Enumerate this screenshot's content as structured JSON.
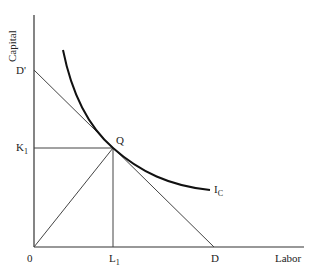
{
  "diagram": {
    "type": "isoquant-isocost",
    "axes": {
      "y_label": "Capital",
      "x_label": "Labor",
      "origin_label": "0"
    },
    "points": {
      "d_prime": "D'",
      "k1": {
        "main": "K",
        "sub": "1"
      },
      "q": "Q",
      "l1": {
        "main": "L",
        "sub": "1"
      },
      "d": "D",
      "isoquant": {
        "main": "I",
        "sub": "C"
      }
    },
    "colors": {
      "line": "#333333",
      "curve": "#111111",
      "background": "#ffffff"
    }
  }
}
